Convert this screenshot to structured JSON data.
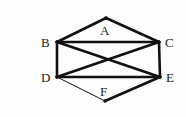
{
  "diagram": {
    "type": "graph",
    "nodes": [
      {
        "id": "A",
        "label": "A",
        "x": 106,
        "y": 18,
        "lx": 100,
        "ly": 35
      },
      {
        "id": "B",
        "label": "B",
        "x": 57,
        "y": 42,
        "lx": 41,
        "ly": 47
      },
      {
        "id": "C",
        "label": "C",
        "x": 159,
        "y": 42,
        "lx": 165,
        "ly": 47
      },
      {
        "id": "D",
        "label": "D",
        "x": 57,
        "y": 77,
        "lx": 41,
        "ly": 82
      },
      {
        "id": "E",
        "label": "E",
        "x": 160,
        "y": 77,
        "lx": 166,
        "ly": 82
      },
      {
        "id": "F",
        "label": "F",
        "x": 105,
        "y": 101,
        "lx": 100,
        "ly": 96
      }
    ],
    "edges": [
      {
        "from": "A",
        "to": "B",
        "weight": "thick"
      },
      {
        "from": "A",
        "to": "C",
        "weight": "thick"
      },
      {
        "from": "B",
        "to": "C",
        "weight": "thick"
      },
      {
        "from": "B",
        "to": "D",
        "weight": "thick"
      },
      {
        "from": "B",
        "to": "E",
        "weight": "thick"
      },
      {
        "from": "C",
        "to": "D",
        "weight": "thick"
      },
      {
        "from": "C",
        "to": "E",
        "weight": "thick"
      },
      {
        "from": "D",
        "to": "E",
        "weight": "thick"
      },
      {
        "from": "D",
        "to": "F",
        "weight": "thin"
      },
      {
        "from": "F",
        "to": "E",
        "weight": "thick"
      }
    ],
    "colors": {
      "edge": "#111111",
      "label": "#222222"
    }
  }
}
